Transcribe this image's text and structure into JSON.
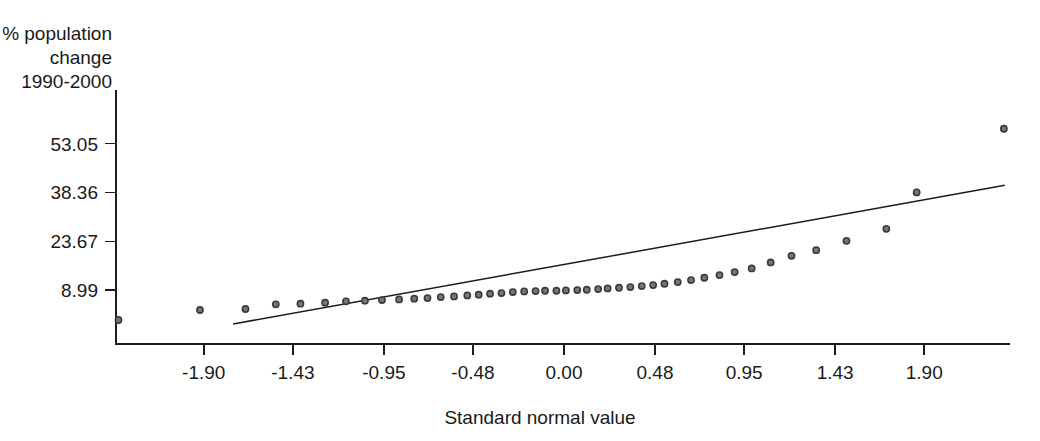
{
  "chart_data": {
    "type": "scatter",
    "title": "",
    "subtitle": "",
    "xlabel": "Standard normal value",
    "ylabel_lines": [
      "% population",
      "change",
      "1990-2000"
    ],
    "ylabel": "% population change 1990-2000",
    "grid": false,
    "legend": null,
    "xlim": [
      -2.35,
      2.35
    ],
    "ylim": [
      -1.5,
      62.0
    ],
    "xticks": [
      -1.9,
      -1.43,
      -0.95,
      -0.48,
      0.0,
      0.48,
      0.95,
      1.43,
      1.9
    ],
    "xtick_labels": [
      "-1.90",
      "-1.43",
      "-0.95",
      "-0.48",
      "0.00",
      "0.48",
      "0.95",
      "1.43",
      "1.90"
    ],
    "yticks": [
      8.99,
      23.67,
      38.36,
      53.05
    ],
    "ytick_labels": [
      "8.99",
      "23.67",
      "38.36",
      "53.05"
    ],
    "series": [
      {
        "name": "observations",
        "marker": "open-circle",
        "x": [
          -2.35,
          -1.92,
          -1.68,
          -1.52,
          -1.39,
          -1.26,
          -1.15,
          -1.05,
          -0.96,
          -0.87,
          -0.79,
          -0.72,
          -0.65,
          -0.58,
          -0.51,
          -0.45,
          -0.39,
          -0.33,
          -0.27,
          -0.21,
          -0.15,
          -0.1,
          -0.04,
          0.01,
          0.07,
          0.12,
          0.18,
          0.23,
          0.29,
          0.35,
          0.41,
          0.47,
          0.53,
          0.6,
          0.67,
          0.74,
          0.82,
          0.9,
          0.99,
          1.09,
          1.2,
          1.33,
          1.49,
          1.7,
          1.86,
          2.32
        ],
        "y": [
          0.0,
          3.0,
          3.3,
          4.7,
          4.9,
          5.2,
          5.6,
          5.8,
          6.0,
          6.2,
          6.4,
          6.6,
          6.9,
          7.1,
          7.4,
          7.6,
          7.9,
          8.1,
          8.4,
          8.6,
          8.7,
          8.8,
          8.8,
          8.9,
          9.0,
          9.1,
          9.3,
          9.5,
          9.7,
          9.9,
          10.2,
          10.5,
          10.9,
          11.4,
          12.0,
          12.7,
          13.5,
          14.4,
          15.5,
          17.3,
          19.3,
          21.0,
          23.8,
          27.4,
          38.36,
          57.5
        ]
      }
    ],
    "reference_line": {
      "name": "normal-fit-line",
      "x_start": -1.745,
      "y_start": -1.2,
      "x_end": 2.325,
      "y_end": 40.5
    }
  },
  "plot": {
    "axis_color": "#1c1c1c",
    "marker_fill": "#777777",
    "marker_stroke": "#3a3a3a",
    "background": "#ffffff"
  }
}
